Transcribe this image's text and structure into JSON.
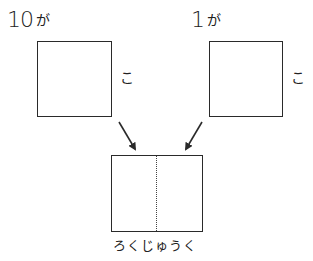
{
  "diagram": {
    "left_group": {
      "number": "10",
      "particle": "が",
      "counter": "こ"
    },
    "right_group": {
      "number": "1",
      "particle": "が",
      "counter": "こ"
    },
    "result": {
      "reading": "ろくじゅうく"
    },
    "colors": {
      "stroke": "#2a2a2a",
      "background": "#ffffff"
    }
  }
}
